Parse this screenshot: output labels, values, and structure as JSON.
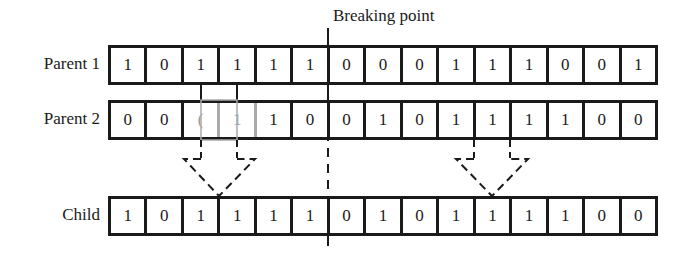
{
  "breaking_point": {
    "label": "Breaking point",
    "after_index": 6
  },
  "rows": [
    {
      "label": "Parent 1",
      "bits": [
        "1",
        "0",
        "1",
        "1",
        "1",
        "1",
        "0",
        "0",
        "0",
        "1",
        "1",
        "1",
        "0",
        "0",
        "1"
      ]
    },
    {
      "label": "Parent 2",
      "bits": [
        "0",
        "0",
        "(",
        "1",
        "1",
        "0",
        "0",
        "1",
        "0",
        "1",
        "1",
        "1",
        "1",
        "0",
        "0"
      ]
    },
    {
      "label": "Child",
      "bits": [
        "1",
        "0",
        "1",
        "1",
        "1",
        "1",
        "0",
        "1",
        "0",
        "1",
        "1",
        "1",
        "1",
        "0",
        "0"
      ]
    }
  ],
  "arrows": [
    {
      "name": "arrow-left",
      "from_cells": [
        3,
        4
      ]
    },
    {
      "name": "arrow-right",
      "from_cells": [
        11,
        12
      ]
    }
  ]
}
